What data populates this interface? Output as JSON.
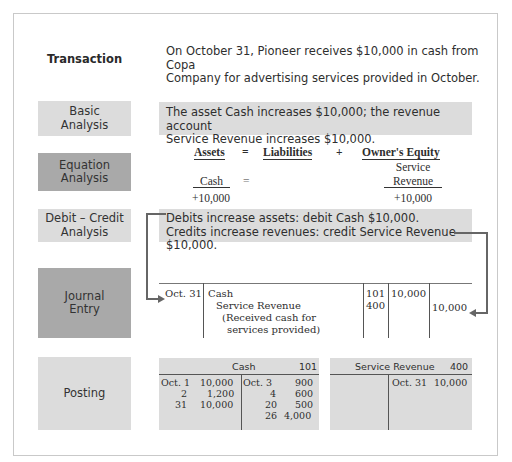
{
  "rows": {
    "transaction": {
      "label": "Transaction",
      "text_line1": "On October 31, Pioneer receives $10,000 in cash from Copa",
      "text_line2": "Company for advertising services provided in October."
    },
    "basic_analysis": {
      "label_line1": "Basic",
      "label_line2": "Analysis",
      "text_line1": "The asset Cash increases $10,000; the revenue account",
      "text_line2": "Service Revenue increases $10,000."
    },
    "equation_analysis": {
      "label_line1": "Equation",
      "label_line2": "Analysis",
      "headers": {
        "assets": "Assets",
        "eq": "=",
        "liabilities": "Liabilities",
        "plus": "+",
        "equity": "Owner's Equity"
      },
      "assets_account": "Cash",
      "assets_eq": "=",
      "equity_account_line1": "Service",
      "equity_account_line2": "Revenue",
      "assets_change": "+10,000",
      "equity_change": "+10,000"
    },
    "debit_credit": {
      "label_line1": "Debit – Credit",
      "label_line2": "Analysis",
      "text_line1": "Debits increase assets: debit Cash $10,000.",
      "text_line2": "Credits increase revenues: credit Service Revenue $10,000."
    },
    "journal_entry": {
      "label_line1": "Journal",
      "label_line2": "Entry",
      "date": "Oct. 31",
      "debit_account": "Cash",
      "credit_account": "Service Revenue",
      "explanation_line1": "(Received cash for",
      "explanation_line2": "services provided)",
      "debit_ref": "101",
      "credit_ref": "400",
      "debit_amount": "10,000",
      "credit_amount": "10,000"
    },
    "posting": {
      "label": "Posting",
      "cash_account": {
        "name": "Cash",
        "number": "101",
        "debits": [
          {
            "date": "Oct. 1",
            "amount": "10,000"
          },
          {
            "date": "2",
            "amount": "1,200"
          },
          {
            "date": "31",
            "amount": "10,000"
          }
        ],
        "credits": [
          {
            "date": "Oct. 3",
            "amount": "900"
          },
          {
            "date": "4",
            "amount": "600"
          },
          {
            "date": "20",
            "amount": "500"
          },
          {
            "date": "26",
            "amount": "4,000"
          }
        ]
      },
      "revenue_account": {
        "name": "Service Revenue",
        "number": "400",
        "credits": [
          {
            "date": "Oct. 31",
            "amount": "10,000"
          }
        ]
      }
    }
  },
  "colors": {
    "light_box": "#dcdcdc",
    "dark_box": "#a9a9a9",
    "arrow": "#666666"
  }
}
